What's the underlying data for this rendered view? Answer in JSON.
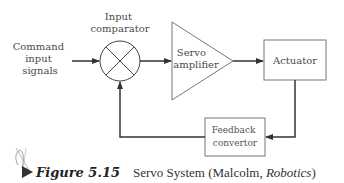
{
  "diagram": {
    "input_label": [
      "Command",
      "input",
      "signals"
    ],
    "comparator_label": [
      "Input",
      "comparator"
    ],
    "amplifier_label": [
      "Servo",
      "amplifier"
    ],
    "actuator_label": "Actuator",
    "feedback_label": [
      "Feedback",
      "convertor"
    ]
  },
  "caption": {
    "number": "Figure 5.15",
    "text_before": "Servo System (Malcolm, ",
    "text_italic": "Robotics",
    "text_after": ")"
  },
  "icons": {
    "figure_marker": "pen-nib-icon"
  }
}
